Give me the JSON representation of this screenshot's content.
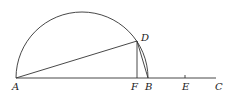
{
  "diagram": {
    "type": "geometry",
    "points": {
      "A": {
        "label": "A",
        "x": 16,
        "y": 78
      },
      "F": {
        "label": "F",
        "x": 136,
        "y": 78
      },
      "B": {
        "label": "B",
        "x": 148,
        "y": 78
      },
      "E": {
        "label": "E",
        "x": 185,
        "y": 78
      },
      "C": {
        "label": "C",
        "x": 216,
        "y": 78
      },
      "D": {
        "label": "D",
        "x": 137,
        "y": 41
      }
    },
    "segments": [
      "AC",
      "AD",
      "DF",
      "DB"
    ],
    "arcs": [
      "semicircle AB through D",
      "arc DB"
    ],
    "ticks": [
      "E"
    ]
  },
  "labels": {
    "A": "A",
    "F": "F",
    "B": "B",
    "E": "E",
    "C": "C",
    "D": "D"
  }
}
